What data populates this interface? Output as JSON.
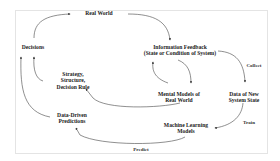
{
  "diagram": {
    "nodes": {
      "real_world": {
        "lines": [
          "Real World"
        ]
      },
      "decisions": {
        "lines": [
          "Decisions"
        ]
      },
      "information_feedback": {
        "lines": [
          "Information Feedback",
          "(State or Condition of System)"
        ]
      },
      "strategy": {
        "lines": [
          "Strategy,",
          "Structure,",
          "Decision Rule"
        ]
      },
      "mental_models": {
        "lines": [
          "Mental Models of",
          "Real World"
        ]
      },
      "data_new_state": {
        "lines": [
          "Data of New",
          "System State"
        ]
      },
      "data_driven_predictions": {
        "lines": [
          "Data-Driven",
          "Predictions"
        ]
      },
      "ml_models": {
        "lines": [
          "Machine Learning",
          "Models"
        ]
      }
    },
    "edge_labels": {
      "collect": "Collect",
      "train": "Train",
      "predict": "Predict"
    },
    "edges": [
      {
        "from": "Decisions",
        "to": "Real World"
      },
      {
        "from": "Real World",
        "to": "Information Feedback"
      },
      {
        "from": "Information Feedback",
        "to": "Mental Models of Real World"
      },
      {
        "from": "Mental Models of Real World",
        "to": "Information Feedback"
      },
      {
        "from": "Information Feedback",
        "to": "Data of New System State",
        "label": "Collect"
      },
      {
        "from": "Data of New System State",
        "to": "Machine Learning Models",
        "label": "Train"
      },
      {
        "from": "Machine Learning Models",
        "to": "Data-Driven Predictions",
        "label": "Predict"
      },
      {
        "from": "Mental Models of Real World",
        "to": "Strategy, Structure, Decision Rule"
      },
      {
        "from": "Strategy, Structure, Decision Rule",
        "to": "Decisions"
      },
      {
        "from": "Data-Driven Predictions",
        "to": "Decisions"
      }
    ],
    "colors": {
      "line": "#333333",
      "text": "#222222",
      "frame": "#e4e4e4"
    }
  }
}
